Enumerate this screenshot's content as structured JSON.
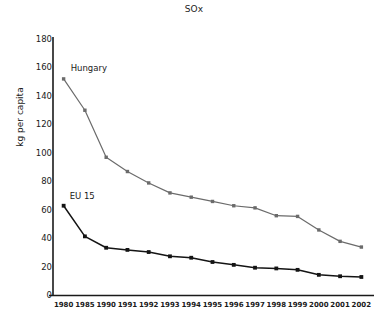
{
  "chart_data": {
    "type": "line",
    "title": "SOx",
    "xlabel": "",
    "ylabel": "kg per capita",
    "categories": [
      "1980",
      "1985",
      "1990",
      "1991",
      "1992",
      "1993",
      "1994",
      "1995",
      "1996",
      "1997",
      "1998",
      "1999",
      "2000",
      "2001",
      "2002"
    ],
    "ylim": [
      0,
      180
    ],
    "yticks": [
      0,
      20,
      40,
      60,
      80,
      100,
      120,
      140,
      160,
      180
    ],
    "grid": false,
    "legend_position": "inline-series-labels",
    "series": [
      {
        "name": "Hungary",
        "color": "#6b6b6b",
        "marker": "square",
        "values": [
          152,
          130,
          97,
          87,
          79,
          72,
          69,
          66,
          63,
          61.5,
          56,
          55.5,
          46,
          38,
          34
        ]
      },
      {
        "name": "EU 15",
        "color": "#141414",
        "marker": "square",
        "values": [
          63,
          41.5,
          33.5,
          32,
          30.5,
          27.5,
          26.5,
          23.5,
          21.5,
          19.5,
          19,
          18,
          14.5,
          13.5,
          13
        ]
      }
    ],
    "axis_color": "#1a1a1a"
  }
}
